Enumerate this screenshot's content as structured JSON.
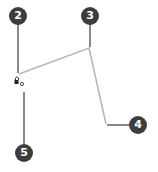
{
  "diagram": {
    "colors": {
      "callout_fill": "#3d3d3d",
      "leader_line": "#4a4a4a",
      "part_line": "#b8b8b8",
      "background": "#ffffff"
    },
    "callouts": [
      {
        "label": "2",
        "x": 18,
        "y": 16
      },
      {
        "label": "3",
        "x": 90,
        "y": 16
      },
      {
        "label": "4",
        "x": 138,
        "y": 125
      },
      {
        "label": "5",
        "x": 24,
        "y": 153
      }
    ]
  }
}
